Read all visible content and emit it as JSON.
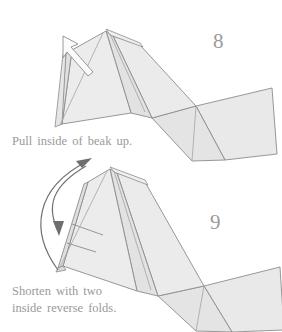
{
  "document": {
    "type": "origami-instruction-diagram",
    "background_color": "#ffffff"
  },
  "palette": {
    "paper_fill_light": "#efefef",
    "paper_fill_mid": "#e6e6e6",
    "paper_fill_dark": "#dcdcdc",
    "stroke": "#8c8c8c",
    "crease_stroke": "#a3a3a3",
    "arrow_stroke": "#6f6f6f",
    "text_color": "#9a9a9a",
    "number_color": "#9b9b9b"
  },
  "steps": [
    {
      "number": "8",
      "caption": "Pull inside of beak up.",
      "arrow_type": "hollow-push-arrow",
      "arrow_direction": "up-left",
      "figure_name": "origami-bird-step-8"
    },
    {
      "number": "9",
      "caption": "Shorten with two\ninside reverse folds.",
      "arrow_type": "curved-rotation-arrows",
      "arrow_direction": "counterclockwise",
      "arrow_count": "2",
      "figure_name": "origami-bird-step-9"
    }
  ]
}
